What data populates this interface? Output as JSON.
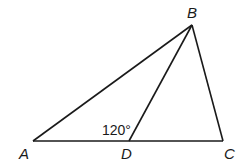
{
  "diagram": {
    "points": {
      "A": {
        "label": "A",
        "x": 33,
        "y": 141
      },
      "B": {
        "label": "B",
        "x": 192,
        "y": 25
      },
      "C": {
        "label": "C",
        "x": 223,
        "y": 141
      },
      "D": {
        "label": "D",
        "x": 129,
        "y": 141
      }
    },
    "segments": [
      "AB",
      "BC",
      "AC",
      "BD"
    ],
    "angle_label": "120°",
    "line_color": "#1a1a1a"
  }
}
